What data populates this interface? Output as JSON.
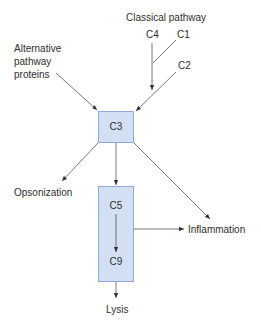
{
  "diagram": {
    "inputs": {
      "classical_label": "Classical pathway",
      "c4": "C4",
      "c1": "C1",
      "c2": "C2",
      "alternative_label_lines": [
        "Alternative",
        "pathway",
        "proteins"
      ]
    },
    "nodes": {
      "c3": "C3",
      "c5": "C5",
      "c9": "C9"
    },
    "outputs": {
      "opsonization": "Opsonization",
      "inflammation": "Inflammation",
      "lysis": "Lysis"
    },
    "colors": {
      "box_fill": "#d3e0f4",
      "box_border": "#8fa9d6",
      "arrow": "#333333"
    }
  }
}
